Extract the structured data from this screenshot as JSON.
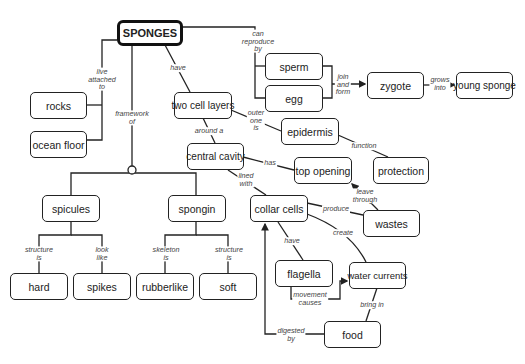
{
  "nodes": {
    "sponges": "SPONGES",
    "rocks": "rocks",
    "ocean_floor": "ocean floor",
    "two_cell_layers": "two cell layers",
    "central_cavity": "central cavity",
    "sperm": "sperm",
    "egg": "egg",
    "zygote": "zygote",
    "young_sponge": "young sponge",
    "epidermis": "epidermis",
    "top_opening": "top opening",
    "protection": "protection",
    "spicules": "spicules",
    "spongin": "spongin",
    "collar_cells": "collar cells",
    "wastes": "wastes",
    "hard": "hard",
    "spikes": "spikes",
    "rubberlike": "rubberlike",
    "soft": "soft",
    "flagella": "flagella",
    "water_currents": "water currents",
    "food": "food"
  },
  "links": {
    "live_attached_to": "live\nattached\nto",
    "framework_of": "framework\nof",
    "have": "have",
    "can_reproduce_by": "can\nreproduce\nby",
    "join_and_form": "join\nand\nform",
    "grows_into": "grows\ninto",
    "outer_one_is": "outer\none\nis",
    "around_a": "around a",
    "function": "function",
    "has": "has",
    "lined_with": "lined\nwith",
    "leave_through": "leave\nthrough",
    "produce": "produce",
    "create": "create",
    "have2": "have",
    "movement_causes": "movement\ncauses",
    "bring_in": "bring in",
    "digested_by": "digested\nby",
    "structure_is_1": "structure\nis",
    "look_like": "look\nlike",
    "skeleton_is": "skeleton\nis",
    "structure_is_2": "structure\nis"
  }
}
